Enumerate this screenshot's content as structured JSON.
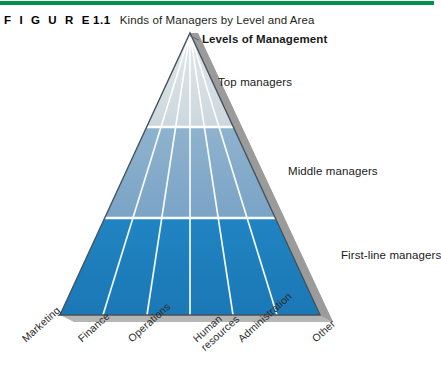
{
  "figure": {
    "label": "F I G U R E",
    "number": "1.1",
    "title": "Kinds of Managers by Level and Area",
    "rule_color": "#00924a"
  },
  "diagram": {
    "heading": "Levels of Management",
    "levels": [
      {
        "name": "top",
        "label": "Top managers",
        "color": "#d5dde1"
      },
      {
        "name": "middle",
        "label": "Middle managers",
        "color": "#7fa8c9"
      },
      {
        "name": "first-line",
        "label": "First-line managers",
        "color": "#1d7fbe"
      }
    ],
    "areas": [
      {
        "line1": "Marketing",
        "line2": ""
      },
      {
        "line1": "Finance",
        "line2": ""
      },
      {
        "line1": "Operations",
        "line2": ""
      },
      {
        "line1": "Human",
        "line2": "resources"
      },
      {
        "line1": "Administration",
        "line2": ""
      },
      {
        "line1": "Other",
        "line2": ""
      }
    ],
    "shadow_color": "#a6a6a6",
    "divider_color": "#ffffff",
    "outline_color": "#3c4a52"
  }
}
